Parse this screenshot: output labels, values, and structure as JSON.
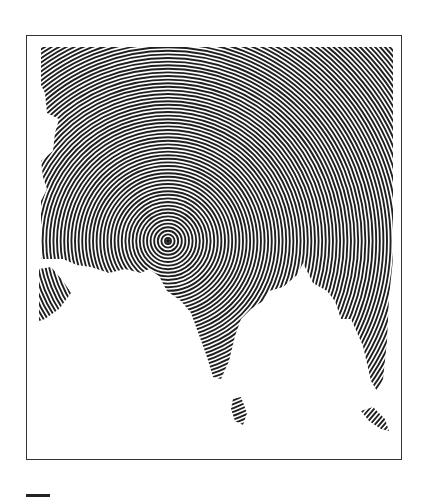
{
  "figure": {
    "type": "concentric-circle map",
    "region": "South Asia",
    "center_point": {
      "x": 167,
      "y": 240
    },
    "colors": {
      "land_lines": "#1a1a1a",
      "water": "#ffffff",
      "frame": "#333333"
    }
  }
}
